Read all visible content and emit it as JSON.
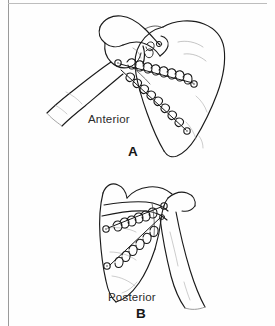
{
  "figure": {
    "background_color": "#fefefe",
    "ink_color": "#1a1a1a",
    "border_color": "#9a9a9a",
    "width": 275,
    "height": 326
  },
  "panels": [
    {
      "id": "panel-a",
      "letter": "A",
      "view_label": "Anterior",
      "description": "Anterior view of scapula with humerus, coracoid process and acromion, showing two coiled wire/suture fixation rows anchored with screws",
      "anchors": 4,
      "suture_rows": 2
    },
    {
      "id": "panel-b",
      "letter": "B",
      "view_label": "Posterior",
      "description": "Posterior view of scapula with scapular spine and humerus, showing two coiled wire/suture fixation rows anchored with screws",
      "anchors": 4,
      "suture_rows": 2
    }
  ],
  "icons": {
    "anchor": "suture-anchor-icon",
    "coil": "coiled-wire-icon"
  }
}
